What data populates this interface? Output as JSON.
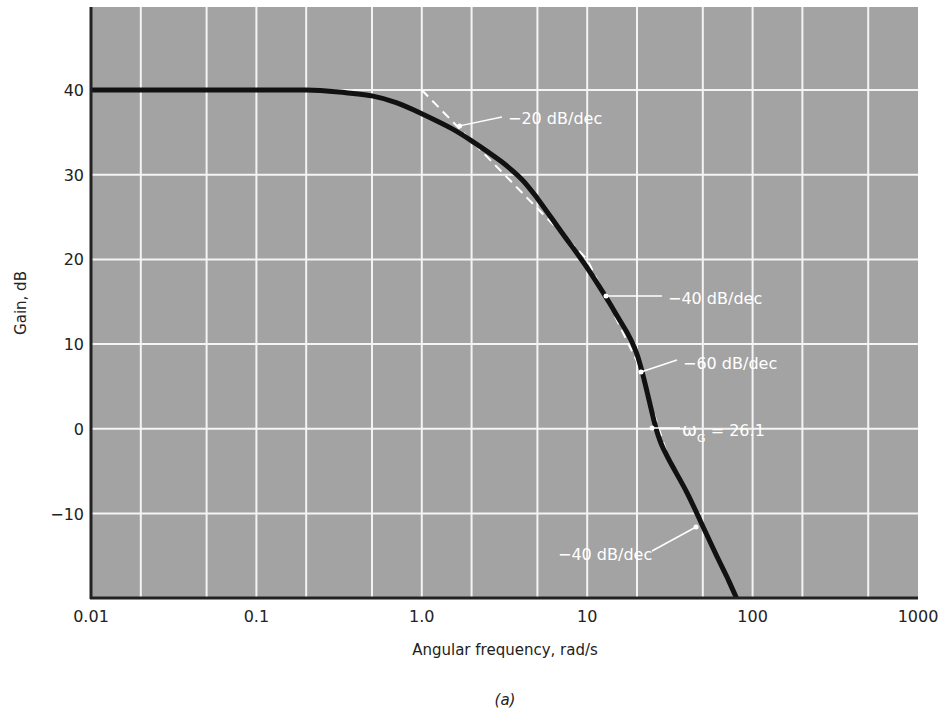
{
  "chart_data": {
    "type": "line",
    "title": "",
    "caption": "(a)",
    "xlabel": "Angular frequency, rad/s",
    "ylabel": "Gain, dB",
    "xscale": "log",
    "xlim": [
      0.01,
      1000
    ],
    "ylim": [
      -20,
      50
    ],
    "xticks": [
      0.01,
      0.1,
      1.0,
      10,
      100,
      1000
    ],
    "xtick_labels": [
      "0.01",
      "0.1",
      "1.0",
      "10",
      "100",
      "1000"
    ],
    "yticks": [
      -10,
      0,
      10,
      20,
      30,
      40
    ],
    "ytick_labels": [
      "−10",
      "0",
      "10",
      "20",
      "30",
      "40"
    ],
    "x_minor_gridlines": [
      0.02,
      0.05,
      0.2,
      0.5,
      2,
      5,
      20,
      50,
      200,
      500
    ],
    "grid": true,
    "plot_background": "#a3a3a3",
    "grid_color": "#f4f4f4",
    "series": [
      {
        "name": "Gain (actual)",
        "style": "solid-thick",
        "color": "#111111",
        "x": [
          0.01,
          0.1,
          0.2,
          0.3,
          0.5,
          0.7,
          1,
          1.5,
          2,
          3,
          4,
          5,
          7,
          10,
          15,
          20,
          26.1,
          30,
          40,
          50,
          60,
          70,
          80
        ],
        "y": [
          40,
          40,
          40,
          39.8,
          39.3,
          38.5,
          37.2,
          35.5,
          34,
          31.6,
          29.5,
          27.2,
          23.2,
          19,
          13.5,
          8.8,
          0,
          -3,
          -7.5,
          -11.5,
          -14.8,
          -17.5,
          -20
        ]
      },
      {
        "name": "Asymptotes",
        "style": "dashed",
        "color": "#ffffff",
        "x": [
          1,
          10,
          20,
          30,
          80
        ],
        "y": [
          40,
          20,
          7.96,
          -2.6,
          -20
        ]
      }
    ],
    "annotations": [
      {
        "text": "−20 dB/dec",
        "target": [
          1.6,
          36
        ]
      },
      {
        "text": "−40 dB/dec",
        "target": [
          14,
          13
        ]
      },
      {
        "text": "−60 dB/dec",
        "target": [
          22,
          5.5
        ]
      },
      {
        "text_main": "ω",
        "text_sub": "G",
        "text_rest": " = 26.1",
        "target": [
          26.1,
          0
        ]
      },
      {
        "text": "−40 dB/dec",
        "target": [
          45,
          -10.5
        ]
      }
    ]
  }
}
